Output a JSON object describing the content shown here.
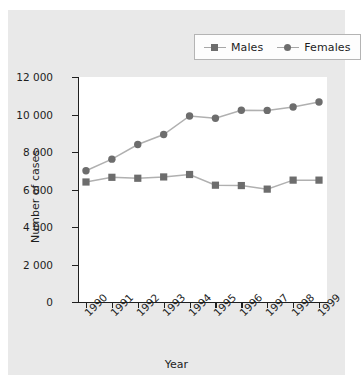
{
  "chart_data": {
    "type": "line",
    "title": "",
    "xlabel": "Year",
    "ylabel": "Number of cases",
    "categories": [
      "1990",
      "1991",
      "1992",
      "1993",
      "1994",
      "1995",
      "1996",
      "1997",
      "1998",
      "1999"
    ],
    "series": [
      {
        "name": "Males",
        "marker": "square",
        "color": "#6d6d6d",
        "values": [
          6400,
          6650,
          6600,
          6670,
          6800,
          6230,
          6210,
          6020,
          6500,
          6500
        ]
      },
      {
        "name": "Females",
        "marker": "circle",
        "color": "#6d6d6d",
        "values": [
          7000,
          7620,
          8400,
          8930,
          9920,
          9800,
          10230,
          10220,
          10400,
          10670
        ]
      }
    ],
    "ylim": [
      0,
      12000
    ],
    "ytick_values": [
      0,
      2000,
      4000,
      6000,
      8000,
      10000,
      12000
    ],
    "ytick_labels": [
      "0",
      "2 000",
      "4 000",
      "6 000",
      "8 000",
      "10 000",
      "12 000"
    ],
    "grid": false,
    "legend_position": "top-right",
    "line_color": "#b0b0b0",
    "plot_background": "#ffffff",
    "figure_background": "#e9e9e9"
  },
  "legend": {
    "entries": [
      {
        "label": "Males",
        "marker": "square"
      },
      {
        "label": "Females",
        "marker": "circle"
      }
    ]
  },
  "axes": {
    "x_title": "Year",
    "y_title": "Number of cases"
  }
}
